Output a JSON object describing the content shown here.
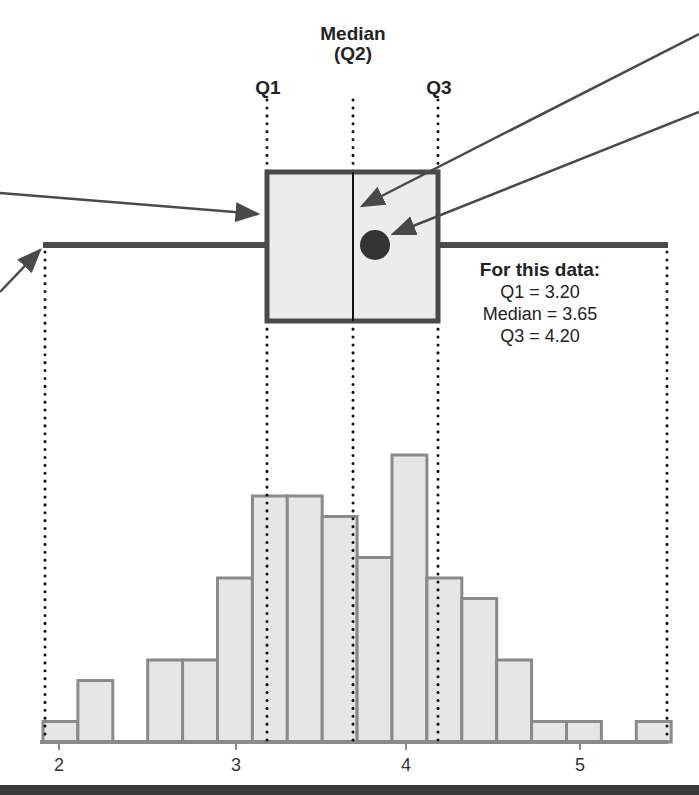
{
  "labels": {
    "q1": "Q1",
    "median_line1": "Median",
    "median_line2": "(Q2)",
    "q3": "Q3"
  },
  "info_box": {
    "title": "For this data:",
    "q1_line": "Q1 = 3.20",
    "median_line": "Median = 3.65",
    "q3_line": "Q3 = 4.20"
  },
  "axis": {
    "ticks": [
      "2",
      "3",
      "4",
      "5"
    ]
  },
  "colors": {
    "bar_fill": "#e6e6e6",
    "bar_stroke": "#8a8a8a",
    "box_stroke": "#4a4a4a",
    "mean_dot": "#333333",
    "text": "#222222"
  },
  "chart_data": {
    "type": "bar",
    "title": "",
    "xlabel": "",
    "ylabel": "",
    "bin_width": 0.2,
    "bin_edges": [
      1.9,
      2.1,
      2.3,
      2.5,
      2.7,
      2.9,
      3.1,
      3.3,
      3.5,
      3.7,
      3.9,
      4.1,
      4.3,
      4.5,
      4.7,
      4.9,
      5.1,
      5.3,
      5.5
    ],
    "categories": [
      "1.9-2.1",
      "2.1-2.3",
      "2.3-2.5",
      "2.5-2.7",
      "2.7-2.9",
      "2.9-3.1",
      "3.1-3.3",
      "3.3-3.5",
      "3.5-3.7",
      "3.7-3.9",
      "3.9-4.1",
      "4.1-4.3",
      "4.3-4.5",
      "4.5-4.7",
      "4.7-4.9",
      "4.9-5.1",
      "5.1-5.3",
      "5.3-5.5"
    ],
    "values": [
      1,
      3,
      0,
      4,
      4,
      8,
      12,
      12,
      11,
      9,
      14,
      8,
      7,
      4,
      1,
      1,
      0,
      1
    ],
    "x_ticks": [
      2,
      3,
      4,
      5
    ],
    "boxplot": {
      "min": 1.9,
      "q1": 3.2,
      "median": 3.65,
      "q3": 4.2,
      "max": 5.5,
      "mean_marker": true
    },
    "annotations": [
      "Q1",
      "Median (Q2)",
      "Q3",
      "For this data: Q1 = 3.20, Median = 3.65, Q3 = 4.20"
    ],
    "grid": false
  }
}
